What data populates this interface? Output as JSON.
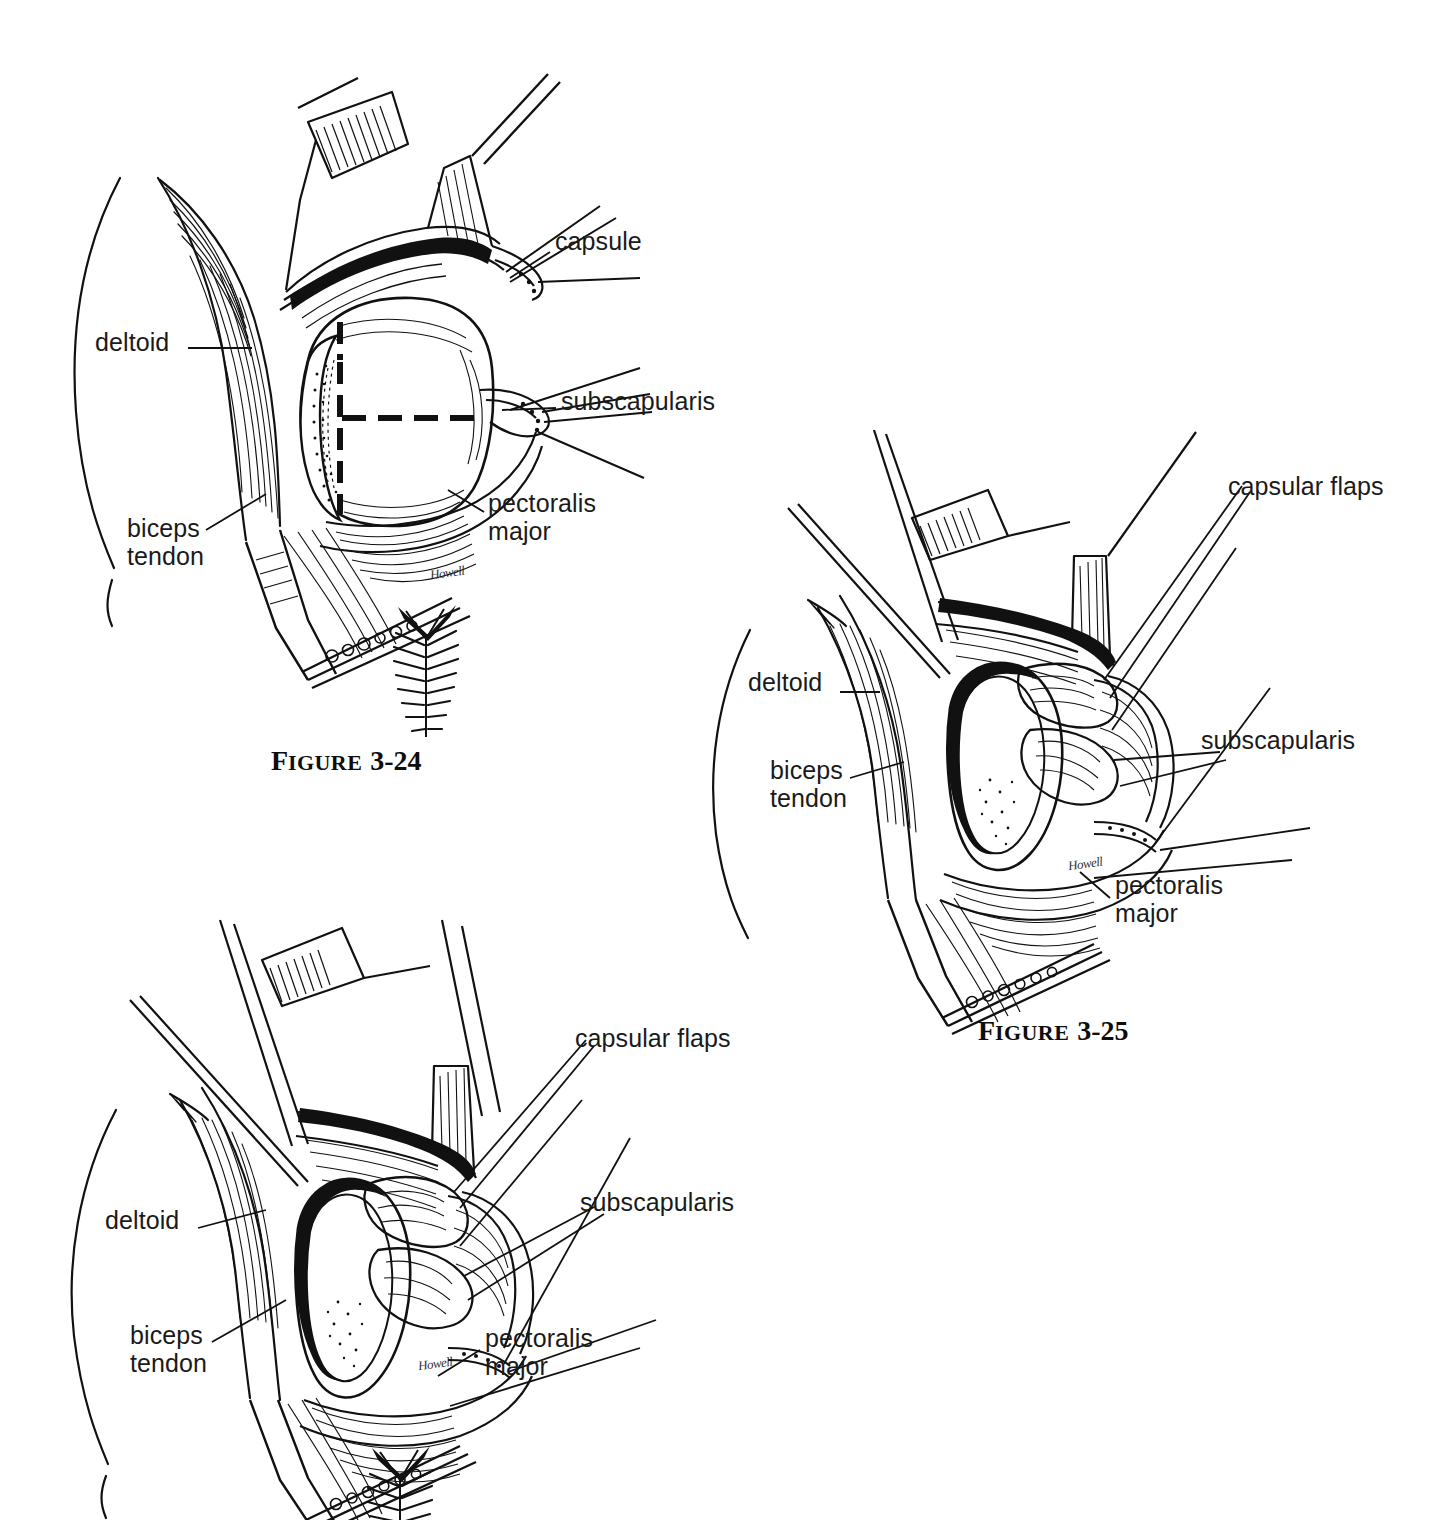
{
  "page": {
    "background": "#ffffff",
    "ink": "#111111",
    "kind": "anatomical-illustration-plate"
  },
  "figures": [
    {
      "id": "fig-324",
      "caption_word": "Figure",
      "caption_number": "3-24",
      "signature": "Howell",
      "labels": [
        {
          "name": "deltoid",
          "text": "deltoid",
          "x": 55,
          "y": 282
        },
        {
          "name": "capsule",
          "text": "capsule",
          "x": 515,
          "y": 181
        },
        {
          "name": "subscapularis",
          "text": "subscapularis",
          "x": 521,
          "y": 341
        },
        {
          "name": "pectoralis-major",
          "text": "pectoralis\nmajor",
          "x": 448,
          "y": 443
        },
        {
          "name": "biceps-tendon",
          "text": "biceps\ntendon",
          "x": 87,
          "y": 468
        }
      ]
    },
    {
      "id": "fig-325",
      "caption_word": "Figure",
      "caption_number": "3-25",
      "signature": "Howell",
      "labels": [
        {
          "name": "capsular-flaps",
          "text": "capsular flaps",
          "x": 538,
          "y": 56
        },
        {
          "name": "subscapularis",
          "text": "subscapularis",
          "x": 511,
          "y": 310
        },
        {
          "name": "deltoid",
          "text": "deltoid",
          "x": 58,
          "y": 252
        },
        {
          "name": "biceps-tendon",
          "text": "biceps\ntendon",
          "x": 80,
          "y": 340
        },
        {
          "name": "pectoralis-major",
          "text": "pectoralis\nmajor",
          "x": 425,
          "y": 455
        }
      ]
    },
    {
      "id": "fig-326",
      "caption_word": "",
      "caption_number": "",
      "signature": "Howell",
      "labels": [
        {
          "name": "capsular-flaps",
          "text": "capsular flaps",
          "x": 545,
          "y": 118
        },
        {
          "name": "subscapularis",
          "text": "subscapularis",
          "x": 550,
          "y": 282
        },
        {
          "name": "deltoid",
          "text": "deltoid",
          "x": 75,
          "y": 300
        },
        {
          "name": "biceps-tendon",
          "text": "biceps\ntendon",
          "x": 100,
          "y": 415
        },
        {
          "name": "pectoralis-major",
          "text": "pectoralis\nmajor",
          "x": 455,
          "y": 418
        }
      ]
    }
  ],
  "anatomy_terms": [
    "deltoid",
    "capsule",
    "capsular flaps",
    "subscapularis",
    "pectoralis major",
    "biceps tendon"
  ]
}
